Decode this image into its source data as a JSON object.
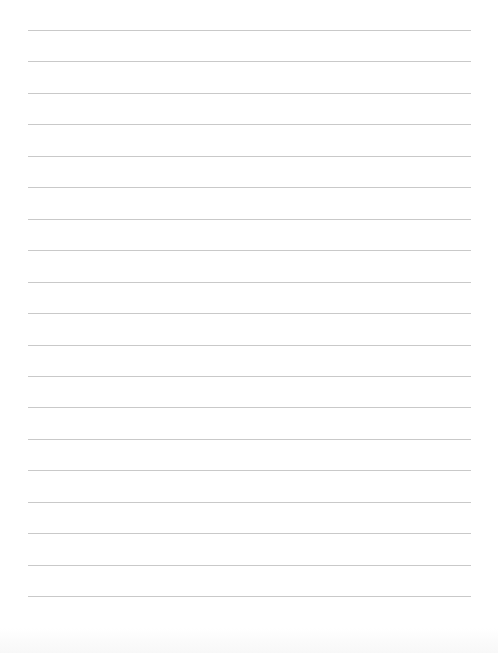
{
  "page": {
    "type": "lined-paper",
    "background_color": "#ffffff",
    "rule_color": "#c9c9c9",
    "rule_count": 19,
    "first_rule_y": 30,
    "rule_spacing": 31.45,
    "rule_left": 28,
    "rule_right": 471,
    "text_lines": []
  }
}
